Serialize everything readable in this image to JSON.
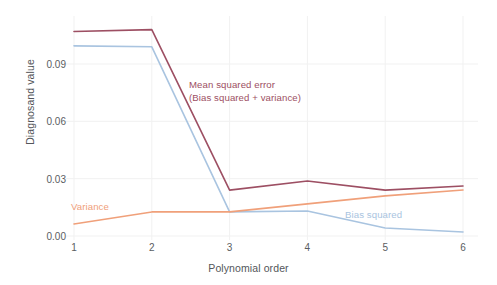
{
  "chart_data": {
    "type": "line",
    "title": "",
    "xlabel": "Polynomial order",
    "ylabel": "Diagnosand value",
    "x": [
      1,
      2,
      3,
      4,
      5,
      6
    ],
    "xtick_labels": [
      "1",
      "2",
      "3",
      "4",
      "5",
      "6"
    ],
    "ytick_labels": [
      "0.00",
      "0.03",
      "0.06",
      "0.09"
    ],
    "ytick_values": [
      0.0,
      0.03,
      0.06,
      0.09
    ],
    "xlim": [
      1,
      6
    ],
    "ylim": [
      0.0,
      0.114
    ],
    "grid": true,
    "grid_axis": "both",
    "legend_position": "inline-annotations",
    "series": [
      {
        "name": "Mean squared error",
        "annotation": "Mean squared error",
        "annotation_line2": "(Bias squared + variance)",
        "color": "#9d4f63",
        "values": [
          0.107,
          0.108,
          0.024,
          0.0288,
          0.024,
          0.0262
        ]
      },
      {
        "name": "Bias squared",
        "annotation": "Bias squared",
        "color": "#a9c4e0",
        "values": [
          0.0995,
          0.099,
          0.0126,
          0.0131,
          0.0042,
          0.0021
        ]
      },
      {
        "name": "Variance",
        "annotation": "Variance",
        "color": "#f0a07a",
        "values": [
          0.0063,
          0.0126,
          0.0126,
          0.0168,
          0.021,
          0.0241
        ]
      }
    ]
  },
  "axes": {
    "y_title": "Diagnosand value",
    "x_title": "Polynomial order",
    "y_ticks": [
      {
        "label": "0.00"
      },
      {
        "label": "0.03"
      },
      {
        "label": "0.06"
      },
      {
        "label": "0.09"
      }
    ],
    "x_ticks": [
      {
        "label": "1"
      },
      {
        "label": "2"
      },
      {
        "label": "3"
      },
      {
        "label": "4"
      },
      {
        "label": "5"
      },
      {
        "label": "6"
      }
    ]
  },
  "annotations": {
    "mse_line1": "Mean squared error",
    "mse_line2": "(Bias squared + variance)",
    "variance": "Variance",
    "bias_squared": "Bias squared"
  },
  "colors": {
    "mse": "#9d4f63",
    "bias": "#a9c4e0",
    "variance": "#f0a07a",
    "grid": "#f0f0f0",
    "text": "#53565a",
    "background": "#ffffff"
  }
}
